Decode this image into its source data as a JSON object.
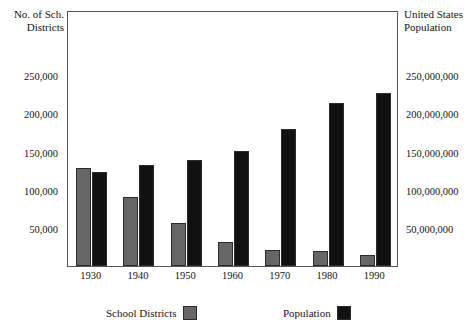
{
  "left_axis": {
    "title": "No. of Sch.\nDistricts",
    "ticks": [
      "250,000",
      "200,000",
      "150,000",
      "100,000",
      "50,000"
    ],
    "tick_values": [
      250000,
      200000,
      150000,
      100000,
      50000
    ]
  },
  "right_axis": {
    "title": "United States\nPopulation",
    "ticks": [
      "250,000,000",
      "200,000,000",
      "150,000,000",
      "100,000,000",
      "50,000,000"
    ],
    "tick_values": [
      250000000,
      200000000,
      150000000,
      100000000,
      50000000
    ]
  },
  "legend": {
    "items": [
      {
        "label": "School Districts",
        "color": "#666666"
      },
      {
        "label": "Population",
        "color": "#111111"
      }
    ]
  },
  "chart_data": {
    "type": "bar",
    "title": "",
    "xlabel": "",
    "ylabel": "No. of Sch. Districts",
    "y2label": "United States Population",
    "categories": [
      "1930",
      "1940",
      "1950",
      "1960",
      "1970",
      "1980",
      "1990"
    ],
    "grid": false,
    "legend_position": "bottom",
    "ylim": [
      0,
      280000
    ],
    "y2lim": [
      0,
      280000000
    ],
    "series": [
      {
        "name": "School Districts",
        "axis": "left",
        "color": "#666666",
        "values": [
          128000,
          90000,
          56000,
          31000,
          21000,
          19000,
          15000
        ]
      },
      {
        "name": "Population",
        "axis": "right",
        "color": "#111111",
        "values": [
          123000000,
          132000000,
          138000000,
          150000000,
          179000000,
          213000000,
          226000000
        ]
      }
    ]
  }
}
